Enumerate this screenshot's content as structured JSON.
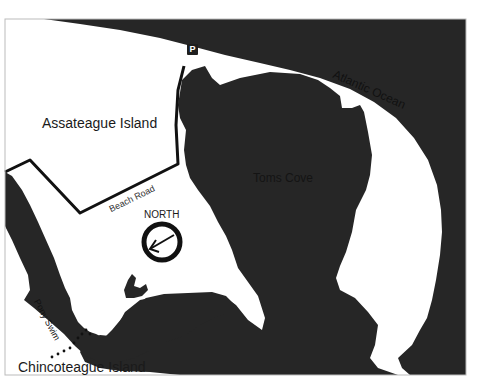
{
  "map": {
    "colors": {
      "water": "#262626",
      "land": "#ffffff",
      "road": "#111111",
      "frame": "#bbbbbb"
    },
    "labels": {
      "assateague": "Assateague Island",
      "atlantic": "Atlantic Ocean",
      "toms_cove": "Toms Cove",
      "beach_road": "Beach Road",
      "north": "NORTH",
      "pony_swim": "Pony Swim",
      "chincoteague": "Chincoteague Island"
    },
    "icons": {
      "parking": {
        "name": "parking-icon",
        "glyph": "P"
      },
      "compass": {
        "name": "compass-north-arrow-icon",
        "direction": "left-down"
      }
    }
  }
}
